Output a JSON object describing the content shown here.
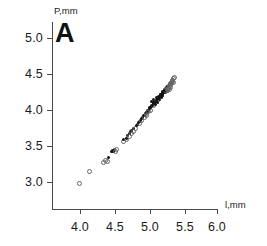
{
  "panel": {
    "label": "A"
  },
  "axes": {
    "y_title": "P,mm",
    "x_title": "l,mm",
    "y_ticks": [
      "5.0",
      "4.5",
      "4.0",
      "3.5",
      "3.0"
    ],
    "x_ticks": [
      "4.0",
      "4.5",
      "5.0",
      "5.5",
      "6.0"
    ]
  },
  "chart_data": {
    "type": "scatter",
    "title": "A",
    "xlabel": "l,mm",
    "ylabel": "P,mm",
    "xlim": [
      3.62,
      6.05
    ],
    "ylim": [
      2.62,
      5.22
    ],
    "xticks": [
      4.0,
      4.5,
      5.0,
      5.5,
      6.0
    ],
    "yticks": [
      3.0,
      3.5,
      4.0,
      4.5,
      5.0
    ],
    "grid": false,
    "legend": null,
    "marker_colors": {
      "filled": "#141414",
      "open": "#666666"
    },
    "series": [
      {
        "name": "measurements",
        "x": [
          3.98,
          4.12,
          4.33,
          4.36,
          4.38,
          4.41,
          4.46,
          4.47,
          4.48,
          4.49,
          4.5,
          4.51,
          4.52,
          4.62,
          4.64,
          4.66,
          4.68,
          4.7,
          4.71,
          4.72,
          4.73,
          4.74,
          4.75,
          4.76,
          4.78,
          4.8,
          4.82,
          4.84,
          4.85,
          4.86,
          4.87,
          4.88,
          4.89,
          4.9,
          4.91,
          4.92,
          4.93,
          4.94,
          4.95,
          4.96,
          4.97,
          4.98,
          4.99,
          5.0,
          5.01,
          5.02,
          5.03,
          5.04,
          5.05,
          5.06,
          5.07,
          5.08,
          5.09,
          5.1,
          5.11,
          5.12,
          5.13,
          5.14,
          5.15,
          5.16,
          5.17,
          5.18,
          5.19,
          5.2,
          5.21,
          5.22,
          5.23,
          5.24,
          5.25,
          5.26,
          5.27,
          5.28,
          5.29,
          5.3,
          5.31,
          5.32,
          5.33,
          5.34,
          5.35,
          5.36,
          5.05,
          5.08,
          5.12,
          5.15,
          5.18,
          5.2,
          5.22,
          5.24,
          5.26,
          5.28,
          5.1,
          5.13,
          5.16,
          5.19,
          5.21,
          5.23,
          5.25,
          5.27,
          5.29,
          5.31,
          4.95,
          4.99,
          5.02,
          5.06,
          5.09,
          5.14,
          5.17,
          5.21,
          5.24,
          5.3,
          5.11,
          5.14,
          5.17,
          5.2,
          5.23,
          5.26,
          5.29,
          5.32,
          5.34,
          5.35
        ],
        "y": [
          2.99,
          3.16,
          3.29,
          3.31,
          3.3,
          3.34,
          3.42,
          3.43,
          3.44,
          3.43,
          3.45,
          3.44,
          3.46,
          3.57,
          3.59,
          3.61,
          3.6,
          3.64,
          3.65,
          3.68,
          3.7,
          3.69,
          3.72,
          3.71,
          3.74,
          3.76,
          3.78,
          3.8,
          3.82,
          3.83,
          3.84,
          3.86,
          3.87,
          3.88,
          3.9,
          3.91,
          3.92,
          3.93,
          3.95,
          3.96,
          3.97,
          3.98,
          3.99,
          4.0,
          4.01,
          4.03,
          4.04,
          4.05,
          4.06,
          4.07,
          4.09,
          4.1,
          4.11,
          4.12,
          4.13,
          4.14,
          4.16,
          4.17,
          4.18,
          4.19,
          4.2,
          4.21,
          4.22,
          4.24,
          4.25,
          4.26,
          4.27,
          4.28,
          4.3,
          4.31,
          4.32,
          4.33,
          4.35,
          4.36,
          4.38,
          4.39,
          4.41,
          4.43,
          4.45,
          4.46,
          4.12,
          4.14,
          4.17,
          4.19,
          4.22,
          4.23,
          4.25,
          4.27,
          4.29,
          4.31,
          4.08,
          4.11,
          4.15,
          4.18,
          4.2,
          4.24,
          4.26,
          4.28,
          4.3,
          4.33,
          3.94,
          3.99,
          4.02,
          4.06,
          4.1,
          4.16,
          4.21,
          4.26,
          4.29,
          4.37,
          4.13,
          4.16,
          4.19,
          4.23,
          4.27,
          4.3,
          4.34,
          4.38,
          4.42,
          4.4
        ],
        "fill": [
          false,
          false,
          false,
          false,
          false,
          true,
          true,
          true,
          true,
          true,
          true,
          false,
          false,
          false,
          true,
          false,
          true,
          true,
          false,
          true,
          true,
          false,
          true,
          false,
          true,
          false,
          true,
          true,
          false,
          true,
          true,
          true,
          false,
          true,
          true,
          false,
          true,
          true,
          true,
          false,
          true,
          true,
          true,
          true,
          false,
          true,
          true,
          true,
          true,
          false,
          true,
          true,
          true,
          true,
          true,
          false,
          true,
          true,
          true,
          true,
          true,
          false,
          true,
          true,
          true,
          true,
          false,
          true,
          true,
          true,
          false,
          true,
          false,
          true,
          false,
          false,
          false,
          false,
          false,
          false,
          true,
          true,
          true,
          true,
          true,
          true,
          true,
          true,
          false,
          false,
          true,
          true,
          true,
          true,
          true,
          true,
          true,
          false,
          false,
          false,
          false,
          false,
          true,
          true,
          true,
          true,
          true,
          true,
          false,
          false,
          true,
          true,
          true,
          true,
          true,
          false,
          false,
          false,
          false,
          false
        ]
      }
    ]
  }
}
